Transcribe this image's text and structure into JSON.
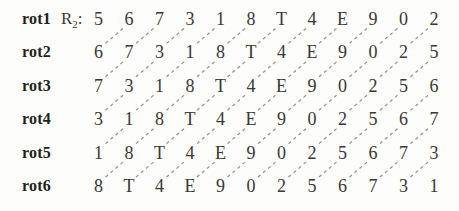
{
  "figure": {
    "colors": {
      "background": "#fdfdfc",
      "text": "#3b3733",
      "label_text": "#241f1c",
      "dashed_line": "#8f8f8f"
    },
    "r2": {
      "base": "R",
      "subscript": "2",
      "suffix": ":"
    },
    "rows": [
      {
        "label": "rot1",
        "cells": [
          "5",
          "6",
          "7",
          "3",
          "1",
          "8",
          "T",
          "4",
          "E",
          "9",
          "0",
          "2"
        ]
      },
      {
        "label": "rot2",
        "cells": [
          "6",
          "7",
          "3",
          "1",
          "8",
          "T",
          "4",
          "E",
          "9",
          "0",
          "2",
          "5"
        ]
      },
      {
        "label": "rot3",
        "cells": [
          "7",
          "3",
          "1",
          "8",
          "T",
          "4",
          "E",
          "9",
          "0",
          "2",
          "5",
          "6"
        ]
      },
      {
        "label": "rot4",
        "cells": [
          "3",
          "1",
          "8",
          "T",
          "4",
          "E",
          "9",
          "0",
          "2",
          "5",
          "6",
          "7"
        ]
      },
      {
        "label": "rot5",
        "cells": [
          "1",
          "8",
          "T",
          "4",
          "E",
          "9",
          "0",
          "2",
          "5",
          "6",
          "7",
          "3"
        ]
      },
      {
        "label": "rot6",
        "cells": [
          "8",
          "T",
          "4",
          "E",
          "9",
          "0",
          "2",
          "5",
          "6",
          "7",
          "3",
          "1"
        ]
      }
    ]
  }
}
